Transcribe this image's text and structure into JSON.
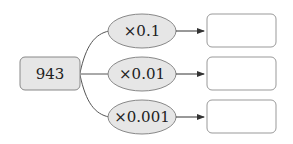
{
  "diagram": {
    "source": {
      "value": "943"
    },
    "operations": [
      {
        "label": "×0.1"
      },
      {
        "label": "×0.01"
      },
      {
        "label": "×0.001"
      }
    ],
    "results": [
      {
        "value": ""
      },
      {
        "value": ""
      },
      {
        "value": ""
      }
    ],
    "colors": {
      "source_fill": "#e6e6e6",
      "ellipse_fill": "#e6e6e6",
      "stroke": "#7a7a7a",
      "result_fill": "#ffffff"
    }
  }
}
